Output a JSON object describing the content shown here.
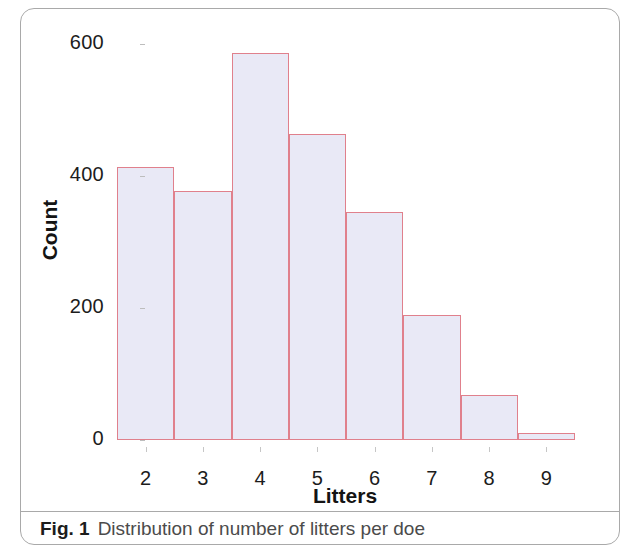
{
  "figure": {
    "caption_label": "Fig. 1",
    "caption_text": "Distribution of number of litters per doe"
  },
  "chart_data": {
    "type": "bar",
    "title": "",
    "xlabel": "Litters",
    "ylabel": "Count",
    "categories": [
      "2",
      "3",
      "4",
      "5",
      "6",
      "7",
      "8",
      "9"
    ],
    "values": [
      414,
      377,
      587,
      464,
      345,
      190,
      68,
      10
    ],
    "yticks": [
      "0",
      "200",
      "400",
      "600"
    ],
    "ytick_values": [
      0,
      200,
      400,
      600
    ],
    "ylim": [
      0,
      620
    ],
    "xlim": [
      1.5,
      9.5
    ],
    "grid": false,
    "legend": false,
    "bar_fill_color": "#e9e9f6",
    "bar_border_color": "#e0808c"
  }
}
